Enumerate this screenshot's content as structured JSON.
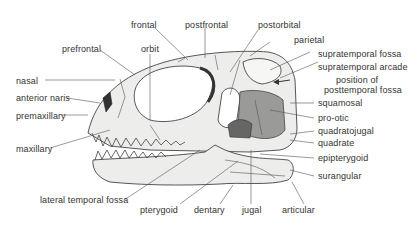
{
  "diagram": {
    "type": "anatomical-skull-lateral-view",
    "colors": {
      "bone": "#ededeb",
      "shade": "#555555",
      "line": "#444444",
      "text": "#333333"
    },
    "labels": {
      "frontal": "frontal",
      "postfrontal": "postfrontal",
      "postorbital": "postorbital",
      "prefrontal": "prefrontal",
      "orbit": "orbit",
      "parietal": "parietal",
      "supratemporal_fossa": "supratemporal fossa",
      "supratemporal_arcade": "supratemporal arcade",
      "posttemporal_1": "position of",
      "posttemporal_2": "posttemporal fossa",
      "nasal": "nasal",
      "anterior_naris": "anterior naris",
      "premaxillary": "premaxillary",
      "maxillary": "maxillary",
      "squamosal": "squamosal",
      "pro_otic": "pro-otic",
      "quadratojugal": "quadratojugal",
      "quadrate": "quadrate",
      "epipterygoid": "epipterygoid",
      "surangular": "surangular",
      "lateral_temporal_fossa": "lateral temporal fossa",
      "pterygoid": "pterygoid",
      "dentary": "dentary",
      "jugal": "jugal",
      "articular": "articular"
    }
  }
}
